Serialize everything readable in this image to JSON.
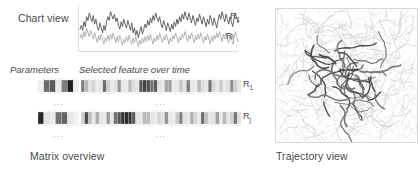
{
  "figure": {
    "chart_view": {
      "label": "Chart view",
      "series_tags": [
        {
          "base": "R",
          "sub": "1"
        },
        {
          "base": "R",
          "sub": "j"
        }
      ]
    },
    "parameters": {
      "label": "Parameters"
    },
    "selected_feature": {
      "label": "Selected feature over time"
    },
    "matrix_overview": {
      "label": "Matrix overview",
      "row_tags": [
        {
          "base": "R",
          "sub": "1"
        },
        {
          "base": "R",
          "sub": "j"
        }
      ],
      "ellipsis": "..."
    },
    "trajectory_view": {
      "label": "Trajectory view"
    }
  },
  "colors": {
    "series_dark": "#555555",
    "series_light": "#aaaaaa",
    "grid": "#e2e2e2",
    "panel_border": "#d8d8d8",
    "text": "#4a4a4a",
    "cell_dark": "#1a1a1a",
    "cell_mid": "#9a9a9a",
    "cell_light": "#d9d9d9",
    "background": "#ffffff"
  },
  "chart_data": {
    "type": "line",
    "title": "Chart view",
    "xlabel": "",
    "ylabel": "",
    "grid": false,
    "legend": "inline-right",
    "series": [
      {
        "name": "R1",
        "color": "#555555",
        "values": [
          32,
          38,
          30,
          44,
          36,
          52,
          46,
          58,
          50,
          44,
          54,
          40,
          48,
          36,
          30,
          42,
          34,
          26,
          38,
          30,
          44,
          52,
          46,
          60,
          54,
          48,
          56,
          44,
          50,
          38,
          32,
          44,
          36,
          48,
          40,
          34,
          46,
          38,
          30,
          42,
          26,
          34,
          22,
          30,
          18,
          28,
          36,
          24,
          32,
          40,
          34,
          46,
          38,
          50,
          42,
          54,
          46,
          58,
          50,
          44,
          52,
          40,
          34,
          46,
          38,
          30,
          42,
          36,
          28,
          40,
          32,
          44,
          36,
          48,
          40,
          52,
          44,
          56,
          48,
          60,
          52,
          46,
          58,
          50,
          42,
          54,
          46,
          38,
          50,
          44,
          56,
          48,
          40,
          52,
          44,
          36,
          48,
          40,
          54,
          46,
          38,
          50,
          42,
          34,
          46,
          56,
          48,
          60,
          52,
          44,
          56,
          48,
          40,
          52,
          44,
          36,
          48,
          58,
          50,
          42
        ]
      },
      {
        "name": "Rj",
        "color": "#aaaaaa",
        "values": [
          18,
          24,
          16,
          28,
          20,
          34,
          26,
          20,
          30,
          22,
          16,
          26,
          18,
          10,
          22,
          14,
          24,
          16,
          8,
          18,
          12,
          22,
          14,
          24,
          16,
          26,
          18,
          10,
          20,
          12,
          22,
          14,
          6,
          16,
          10,
          20,
          12,
          22,
          14,
          8,
          18,
          10,
          20,
          12,
          4,
          14,
          8,
          18,
          10,
          20,
          12,
          22,
          14,
          24,
          16,
          8,
          18,
          12,
          22,
          14,
          26,
          18,
          10,
          20,
          14,
          24,
          16,
          8,
          18,
          12,
          22,
          16,
          26,
          18,
          10,
          20,
          14,
          24,
          18,
          28,
          20,
          12,
          22,
          16,
          26,
          18,
          10,
          22,
          14,
          24,
          16,
          26,
          18,
          10,
          20,
          14,
          24,
          16,
          8,
          20,
          12,
          22,
          16,
          26,
          18,
          28,
          20,
          12,
          24,
          16,
          26,
          18,
          10,
          22,
          14,
          24,
          18,
          28,
          20,
          12
        ]
      }
    ],
    "ylim": [
      0,
      66
    ],
    "xlim": [
      0,
      119
    ]
  },
  "matrix_data": {
    "type": "heatmap",
    "parameters_matrix": {
      "columns": 7,
      "rows": [
        [
          0.06,
          0.62,
          0.7,
          0.1,
          0.55,
          0.95,
          0.08
        ],
        [
          0.92,
          0.12,
          0.08,
          0.6,
          0.66,
          0.1,
          0.05
        ]
      ]
    },
    "feature_matrix": {
      "columns": 44,
      "rows": [
        [
          0.55,
          0.3,
          0.12,
          0.18,
          0.08,
          0.1,
          0.62,
          0.2,
          0.08,
          0.12,
          0.45,
          0.1,
          0.08,
          0.3,
          0.14,
          0.1,
          0.72,
          0.8,
          0.75,
          0.6,
          0.7,
          0.12,
          0.1,
          0.38,
          0.42,
          0.08,
          0.1,
          0.25,
          0.12,
          0.55,
          0.1,
          0.08,
          0.3,
          0.14,
          0.1,
          0.6,
          0.18,
          0.1,
          0.22,
          0.08,
          0.12,
          0.48,
          0.2,
          0.1
        ],
        [
          0.2,
          0.75,
          0.28,
          0.1,
          0.35,
          0.12,
          0.08,
          0.42,
          0.1,
          0.6,
          0.72,
          0.85,
          0.9,
          0.88,
          0.7,
          0.12,
          0.1,
          0.3,
          0.28,
          0.1,
          0.08,
          0.18,
          0.12,
          0.45,
          0.1,
          0.08,
          0.22,
          0.55,
          0.12,
          0.1,
          0.35,
          0.18,
          0.08,
          0.62,
          0.25,
          0.1,
          0.12,
          0.4,
          0.08,
          0.3,
          0.1,
          0.2,
          0.58,
          0.12
        ]
      ]
    }
  }
}
